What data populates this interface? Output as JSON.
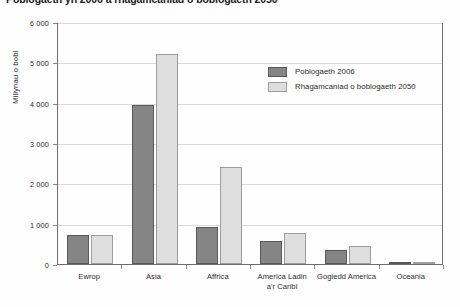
{
  "chart_data": {
    "type": "bar",
    "title": "Poblogaeth yn 2006 a rhagamcaniad o boblogaeth 2050",
    "xlabel": "",
    "ylabel": "Miliynau o bobl",
    "ylim": [
      0,
      6000
    ],
    "ytick_labels": [
      "6 000",
      "5 000",
      "4 000",
      "3 000",
      "2 000",
      "1 000",
      "0"
    ],
    "ytick_values": [
      6000,
      5000,
      4000,
      3000,
      2000,
      1000,
      0
    ],
    "grid": true,
    "legend_position": "upper-right",
    "categories": [
      "Ewrop",
      "Asia",
      "Affrica",
      "America Ladin\na'r Caribî",
      "Gogledd America",
      "Oceania"
    ],
    "category_lines": [
      [
        "Ewrop"
      ],
      [
        "Asia"
      ],
      [
        "Affrica"
      ],
      [
        "America Ladin",
        "a'r Caribî"
      ],
      [
        "Gogledd America"
      ],
      [
        "Oceania"
      ]
    ],
    "series": [
      {
        "name": "Poblogaeth 2006",
        "color": "#858585",
        "values": [
          730,
          3940,
          920,
          570,
          340,
          35
        ]
      },
      {
        "name": "Rhagamcaniad o boblogaeth 2050",
        "color": "#dedede",
        "values": [
          720,
          5200,
          2400,
          780,
          450,
          50
        ]
      }
    ]
  },
  "legend": {
    "items": [
      {
        "label": "Poblogaeth 2006"
      },
      {
        "label": "Rhagamcaniad o boblogaeth 2050"
      }
    ]
  }
}
